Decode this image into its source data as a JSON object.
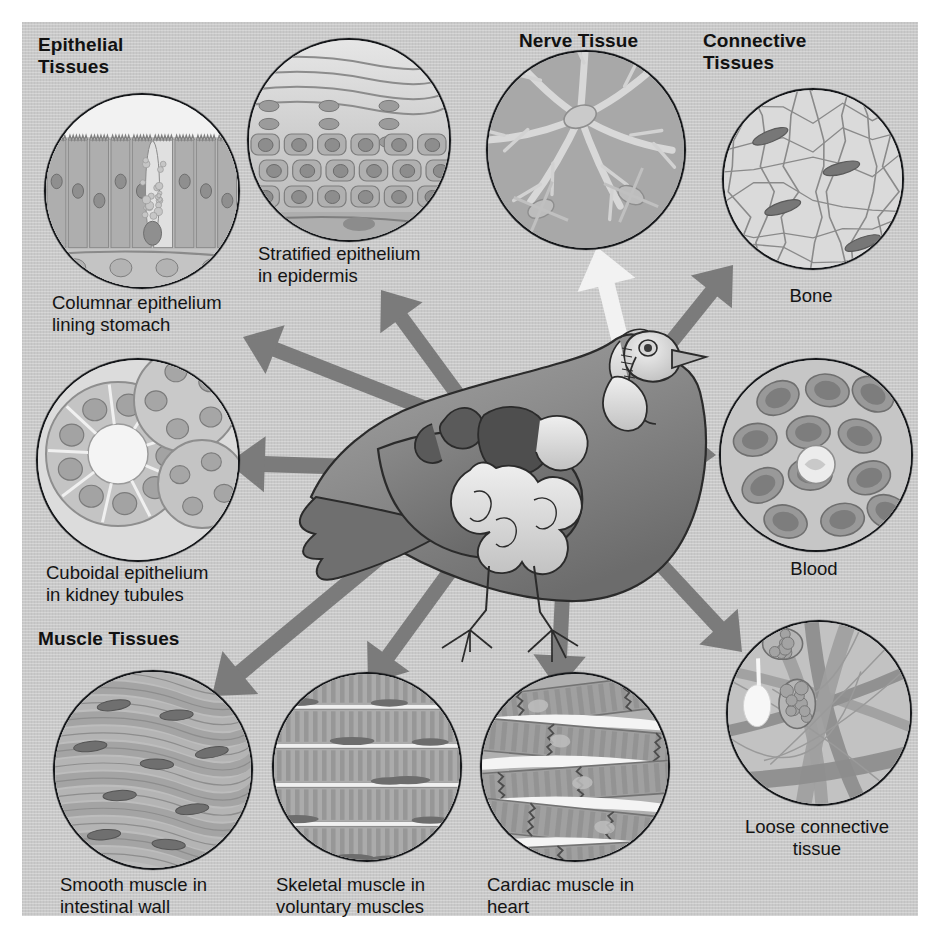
{
  "figure": {
    "center_subject": "bird-with-internal-organs",
    "background_color": "#c9c9c9",
    "arrow_color": "#7b7b7b",
    "nerve_arrow_color": "#f2f2f2",
    "ink_color": "#15171a"
  },
  "groups": [
    {
      "id": "epithelial",
      "label": "Epithelial\nTissues",
      "x": 38,
      "y": 34
    },
    {
      "id": "nerve",
      "label": "Nerve Tissue",
      "x": 519,
      "y": 30
    },
    {
      "id": "connective",
      "label": "Connective\nTissues",
      "x": 703,
      "y": 30
    },
    {
      "id": "muscle",
      "label": "Muscle Tissues",
      "x": 38,
      "y": 628
    }
  ],
  "panels": [
    {
      "id": "columnar",
      "caption": "Columnar epithelium\nlining stomach",
      "group": "epithelial",
      "art": "columnar-epithelium",
      "circle": {
        "x": 44,
        "y": 93,
        "d": 192
      },
      "caption_pos": {
        "x": 52,
        "y": 292,
        "w": 230,
        "align": "left"
      }
    },
    {
      "id": "stratified",
      "caption": "Stratified epithelium\nin epidermis",
      "group": "epithelial",
      "art": "stratified-epithelium",
      "circle": {
        "x": 247,
        "y": 38,
        "d": 200
      },
      "caption_pos": {
        "x": 258,
        "y": 243,
        "w": 230,
        "align": "left"
      }
    },
    {
      "id": "cuboidal",
      "caption": "Cuboidal epithelium\nin kidney tubules",
      "group": "epithelial",
      "art": "cuboidal-epithelium",
      "circle": {
        "x": 36,
        "y": 358,
        "d": 200
      },
      "caption_pos": {
        "x": 46,
        "y": 562,
        "w": 240,
        "align": "left"
      }
    },
    {
      "id": "nerve",
      "caption": "",
      "group": "nerve",
      "art": "nerve-tissue",
      "circle": {
        "x": 486,
        "y": 50,
        "d": 196
      },
      "caption_pos": {
        "x": 0,
        "y": 0,
        "w": 0,
        "align": "left"
      }
    },
    {
      "id": "bone",
      "caption": "Bone",
      "group": "connective",
      "art": "bone-tissue",
      "circle": {
        "x": 722,
        "y": 88,
        "d": 178
      },
      "caption_pos": {
        "x": 722,
        "y": 285,
        "w": 178,
        "align": "center"
      }
    },
    {
      "id": "blood",
      "caption": "Blood",
      "group": "connective",
      "art": "blood-tissue",
      "circle": {
        "x": 719,
        "y": 358,
        "d": 190
      },
      "caption_pos": {
        "x": 719,
        "y": 558,
        "w": 190,
        "align": "center"
      }
    },
    {
      "id": "loose",
      "caption": "Loose connective\ntissue",
      "group": "connective",
      "art": "loose-connective-tissue",
      "circle": {
        "x": 726,
        "y": 620,
        "d": 182
      },
      "caption_pos": {
        "x": 706,
        "y": 816,
        "w": 222,
        "align": "center"
      }
    },
    {
      "id": "smooth",
      "caption": "Smooth muscle in\nintestinal wall",
      "group": "muscle",
      "art": "smooth-muscle",
      "circle": {
        "x": 53,
        "y": 670,
        "d": 196
      },
      "caption_pos": {
        "x": 60,
        "y": 874,
        "w": 230,
        "align": "left"
      }
    },
    {
      "id": "skeletal",
      "caption": "Skeletal muscle in\nvoluntary muscles",
      "group": "muscle",
      "art": "skeletal-muscle",
      "circle": {
        "x": 272,
        "y": 672,
        "d": 186
      },
      "caption_pos": {
        "x": 276,
        "y": 874,
        "w": 240,
        "align": "left"
      }
    },
    {
      "id": "cardiac",
      "caption": "Cardiac muscle in\nheart",
      "group": "muscle",
      "art": "cardiac-muscle",
      "circle": {
        "x": 480,
        "y": 672,
        "d": 186
      },
      "caption_pos": {
        "x": 487,
        "y": 874,
        "w": 230,
        "align": "left"
      }
    }
  ],
  "arrows": [
    {
      "id": "to-columnar",
      "from": [
        455,
        420
      ],
      "to": [
        243,
        337
      ],
      "color": "#7b7b7b",
      "w": 15
    },
    {
      "id": "to-stratified",
      "from": [
        500,
        452
      ],
      "to": [
        381,
        290
      ],
      "color": "#7b7b7b",
      "w": 15
    },
    {
      "id": "to-cuboidal",
      "from": [
        448,
        470
      ],
      "to": [
        228,
        463
      ],
      "color": "#7b7b7b",
      "w": 16
    },
    {
      "id": "to-nerve",
      "from": [
        622,
        348
      ],
      "to": [
        597,
        247
      ],
      "color": "#f2f2f2",
      "w": 17
    },
    {
      "id": "to-bone",
      "from": [
        623,
        402
      ],
      "to": [
        733,
        265
      ],
      "color": "#7b7b7b",
      "w": 15
    },
    {
      "id": "to-blood",
      "from": [
        631,
        452
      ],
      "to": [
        716,
        455
      ],
      "color": "#7b7b7b",
      "w": 15
    },
    {
      "id": "to-loose",
      "from": [
        610,
        510
      ],
      "to": [
        742,
        652
      ],
      "color": "#7b7b7b",
      "w": 15
    },
    {
      "id": "to-smooth",
      "from": [
        452,
        497
      ],
      "to": [
        212,
        696
      ],
      "color": "#7b7b7b",
      "w": 16
    },
    {
      "id": "to-skeletal",
      "from": [
        486,
        522
      ],
      "to": [
        368,
        684
      ],
      "color": "#7b7b7b",
      "w": 15
    },
    {
      "id": "to-cardiac",
      "from": [
        565,
        540
      ],
      "to": [
        558,
        690
      ],
      "color": "#7b7b7b",
      "w": 15
    }
  ]
}
